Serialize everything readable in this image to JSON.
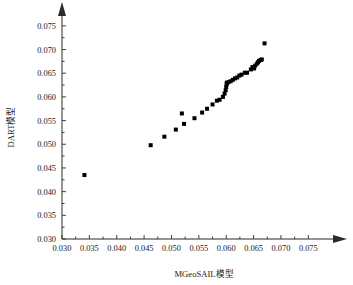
{
  "chart_data": {
    "type": "scatter",
    "title": "",
    "xlabel": "MGeoSAIL模型",
    "ylabel": "DART模型",
    "xlim": [
      0.03,
      0.0775
    ],
    "ylim": [
      0.03,
      0.0775
    ],
    "xticks": [
      0.03,
      0.035,
      0.04,
      0.045,
      0.05,
      0.055,
      0.06,
      0.065,
      0.07,
      0.075
    ],
    "yticks": [
      0.03,
      0.035,
      0.04,
      0.045,
      0.05,
      0.055,
      0.06,
      0.065,
      0.07,
      0.075
    ],
    "xtick_labels": [
      "0.030",
      "0.035",
      "0.040",
      "0.045",
      "0.050",
      "0.055",
      "0.060",
      "0.065",
      "0.070",
      "0.075"
    ],
    "ytick_labels": [
      "0.030",
      "0.035",
      "0.040",
      "0.045",
      "0.050",
      "0.055",
      "0.060",
      "0.065",
      "0.070",
      "0.075"
    ],
    "grid": false,
    "legend": null,
    "marker_style": "filled-square",
    "marker_color": "#000000",
    "marker_size_px": 4,
    "axis_arrows": true,
    "series": [
      {
        "name": "MGeoSAIL vs DART",
        "points": [
          [
            0.0341,
            0.0435
          ],
          [
            0.0462,
            0.0498
          ],
          [
            0.0487,
            0.0516
          ],
          [
            0.0508,
            0.0531
          ],
          [
            0.0519,
            0.0565
          ],
          [
            0.0523,
            0.0543
          ],
          [
            0.0542,
            0.0555
          ],
          [
            0.0556,
            0.0567
          ],
          [
            0.0565,
            0.0575
          ],
          [
            0.0575,
            0.0584
          ],
          [
            0.0583,
            0.0592
          ],
          [
            0.0588,
            0.0594
          ],
          [
            0.0594,
            0.06
          ],
          [
            0.0597,
            0.0607
          ],
          [
            0.0599,
            0.0614
          ],
          [
            0.06,
            0.0621
          ],
          [
            0.0601,
            0.0627
          ],
          [
            0.0601,
            0.063
          ],
          [
            0.0604,
            0.0631
          ],
          [
            0.0608,
            0.0633
          ],
          [
            0.0612,
            0.0636
          ],
          [
            0.0616,
            0.0639
          ],
          [
            0.062,
            0.0641
          ],
          [
            0.0624,
            0.0645
          ],
          [
            0.0628,
            0.0647
          ],
          [
            0.0634,
            0.0651
          ],
          [
            0.0638,
            0.0651
          ],
          [
            0.0645,
            0.0658
          ],
          [
            0.0648,
            0.0663
          ],
          [
            0.0651,
            0.066
          ],
          [
            0.0653,
            0.0666
          ],
          [
            0.0656,
            0.067
          ],
          [
            0.0658,
            0.0673
          ],
          [
            0.066,
            0.0676
          ],
          [
            0.0663,
            0.0678
          ],
          [
            0.0665,
            0.0679
          ],
          [
            0.067,
            0.0713
          ]
        ]
      }
    ]
  }
}
